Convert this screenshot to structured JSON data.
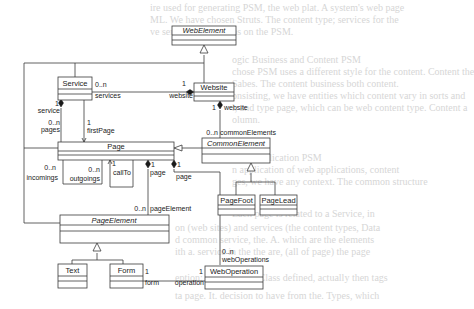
{
  "background_text": [
    "ire used for generating PSM, the web plat. A system's web page",
    "ML. We have chosen Struts. The content type; services for the",
    "ve service applications on the PSM.",
    "ogic Business and Content PSM",
    "chose PSM uses a different style for the content. Content the",
    "Sabes. The content business both content.",
    "onsisting, we have entities which content vary in sorts and",
    "l, and type page, which can be web content type. Content a",
    "olumn.",
    "",
    "Web Application PSM",
    "n application of web applications, content",
    "ges, we have any context. The common structure",
    "Each page is related to a Service, in",
    "on (web sites) and services (the content types, Data",
    "d common service, the. A. which are the elements",
    "ith a. service in the the are, (all of page) the page",
    "eption: page, which. Class defined, actually then tags",
    "ta page. It. decision to have from the. Types, which"
  ],
  "classes": {
    "web_element": {
      "name": "WebElement",
      "abstract": true
    },
    "website": {
      "name": "Website",
      "abstract": false
    },
    "service": {
      "name": "Service",
      "abstract": false
    },
    "page": {
      "name": "Page",
      "abstract": false
    },
    "common_element": {
      "name": "CommonElement",
      "abstract": true
    },
    "page_foot": {
      "name": "PageFoot",
      "abstract": false
    },
    "page_lead": {
      "name": "PageLead",
      "abstract": false
    },
    "page_element": {
      "name": "PageElement",
      "abstract": true
    },
    "text": {
      "name": "Text",
      "abstract": false
    },
    "form": {
      "name": "Form",
      "abstract": false
    },
    "web_operation": {
      "name": "WebOperation",
      "abstract": false
    }
  },
  "associations": {
    "service_website": {
      "service_mult": "0..n",
      "service_role": "services",
      "website_mult": "1",
      "website_role": "website"
    },
    "service_pages": {
      "service_mult": "1",
      "service_role": "service",
      "pages_mult": "0..n",
      "pages_role": "pages"
    },
    "service_firstpage": {
      "mult": "1",
      "role": "firstPage"
    },
    "website_common": {
      "website_mult": "1",
      "website_role": "website",
      "common_mult": "0..n",
      "common_role": "commonElements"
    },
    "page_links": {
      "incomings_mult": "0..n",
      "incomings_role": "incomings",
      "outgoings_mult": "0..n",
      "outgoings_role": "outgoings"
    },
    "page_callto": {
      "mult": "1",
      "role": "callTo"
    },
    "page_pageelement": {
      "page_mult": "1",
      "page_role": "page",
      "element_mult": "0..n",
      "element_role": "pageElement"
    },
    "page_weboperation": {
      "page_mult": "1",
      "page_role": "page",
      "op_mult": "0..n",
      "op_role": "webOperations"
    },
    "form_operation": {
      "form_mult": "1",
      "form_role": "form",
      "op_mult": "1",
      "op_role": "operation"
    }
  }
}
